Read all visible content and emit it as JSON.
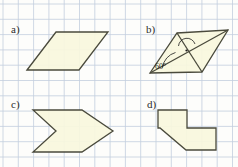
{
  "figure": {
    "width": 238,
    "height": 167,
    "background_color": "#fdfdfb",
    "grid": {
      "visible": true,
      "spacing": 15.3,
      "line_color": "#c3cede",
      "line_width": 0.8,
      "origin_x": 3,
      "origin_y": 4
    },
    "style": {
      "shape_fill": "#f8f7dd",
      "shape_stroke": "#4a4a3c",
      "shape_stroke_width": 1.3,
      "label_color": "#2b2b2b",
      "annotation_color": "#1c1c1c"
    },
    "panels": [
      {
        "id": "a",
        "label": "a)",
        "label_x": 11,
        "label_y": 24,
        "shape_name": "parallelogram",
        "points": "27,70 56,32 108,32 79,70",
        "annotations": []
      },
      {
        "id": "b",
        "label": "b)",
        "label_x": 146,
        "label_y": 24,
        "shape_name": "parallelogram-with-diagonals",
        "points": "150,73 177,33 228,30 202,72",
        "annotations": [
          {
            "kind": "diagonal",
            "name": "diagonal-bottom-left-to-top-right",
            "x1": 150,
            "y1": 73,
            "x2": 228,
            "y2": 30
          },
          {
            "kind": "diagonal",
            "name": "diagonal-top-left-to-bottom-right",
            "x1": 177,
            "y1": 33,
            "x2": 202,
            "y2": 72
          },
          {
            "kind": "angle-arc",
            "name": "angle-arc-60",
            "text": "60°",
            "text_x": 155,
            "text_y": 63
          },
          {
            "kind": "angle-marker",
            "name": "angle-marker-center-dot"
          }
        ]
      },
      {
        "id": "c",
        "label": "c)",
        "label_x": 11,
        "label_y": 99,
        "shape_name": "arrow-chevron-right",
        "points": "33,110 82,110 113,131 82,152 33,152 56,131",
        "annotations": []
      },
      {
        "id": "d",
        "label": "d)",
        "label_x": 147,
        "label_y": 99,
        "shape_name": "zigzag-arrow-polygon",
        "points": "158,110 187,110 187,128 216,128 216,150 186,150 160,128 158,128 158,110"
      }
    ]
  }
}
